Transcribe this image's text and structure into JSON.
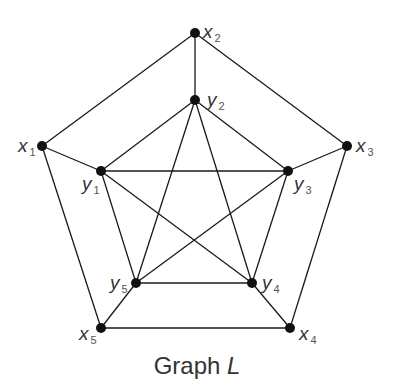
{
  "caption": {
    "prefix": "Graph ",
    "name": "L"
  },
  "nodes": [
    {
      "id": "x1",
      "letter": "x",
      "sub": "1",
      "x": 42,
      "y": 146,
      "lx": 18,
      "ly": 152
    },
    {
      "id": "x2",
      "letter": "x",
      "sub": "2",
      "x": 195,
      "y": 33,
      "lx": 203,
      "ly": 38
    },
    {
      "id": "x3",
      "letter": "x",
      "sub": "3",
      "x": 347,
      "y": 146,
      "lx": 356,
      "ly": 152
    },
    {
      "id": "x4",
      "letter": "x",
      "sub": "4",
      "x": 290,
      "y": 328,
      "lx": 299,
      "ly": 340
    },
    {
      "id": "x5",
      "letter": "x",
      "sub": "5",
      "x": 101,
      "y": 328,
      "lx": 79,
      "ly": 340
    },
    {
      "id": "y1",
      "letter": "y",
      "sub": "1",
      "x": 101,
      "y": 171,
      "lx": 82,
      "ly": 190
    },
    {
      "id": "y2",
      "letter": "y",
      "sub": "2",
      "x": 195,
      "y": 100,
      "lx": 207,
      "ly": 106
    },
    {
      "id": "y3",
      "letter": "y",
      "sub": "3",
      "x": 288,
      "y": 171,
      "lx": 294,
      "ly": 190
    },
    {
      "id": "y4",
      "letter": "y",
      "sub": "4",
      "x": 252,
      "y": 283,
      "lx": 262,
      "ly": 289
    },
    {
      "id": "y5",
      "letter": "y",
      "sub": "5",
      "x": 136,
      "y": 283,
      "lx": 110,
      "ly": 289
    }
  ],
  "edges": [
    [
      "x1",
      "x2"
    ],
    [
      "x2",
      "x3"
    ],
    [
      "x3",
      "x4"
    ],
    [
      "x4",
      "x5"
    ],
    [
      "x5",
      "x1"
    ],
    [
      "x1",
      "y1"
    ],
    [
      "x2",
      "y2"
    ],
    [
      "x3",
      "y3"
    ],
    [
      "x4",
      "y4"
    ],
    [
      "x5",
      "y5"
    ],
    [
      "y1",
      "y2"
    ],
    [
      "y2",
      "y3"
    ],
    [
      "y1",
      "y3"
    ],
    [
      "y1",
      "y4"
    ],
    [
      "y1",
      "y5"
    ],
    [
      "y2",
      "y4"
    ],
    [
      "y2",
      "y5"
    ],
    [
      "y3",
      "y4"
    ],
    [
      "y3",
      "y5"
    ],
    [
      "y4",
      "y5"
    ]
  ],
  "colors": {
    "edge": "#1a1a1a",
    "node": "#111111",
    "label": "#333333"
  }
}
